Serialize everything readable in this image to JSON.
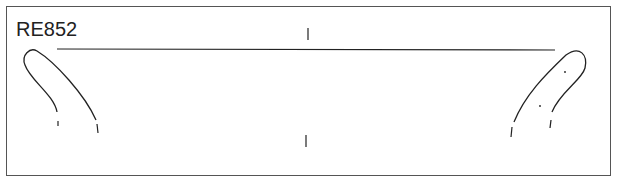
{
  "figure": {
    "label": "RE852",
    "type": "pottery rim profile drawing",
    "colors": {
      "line": "#222222",
      "frame": "#555555",
      "background": "#ffffff"
    }
  }
}
